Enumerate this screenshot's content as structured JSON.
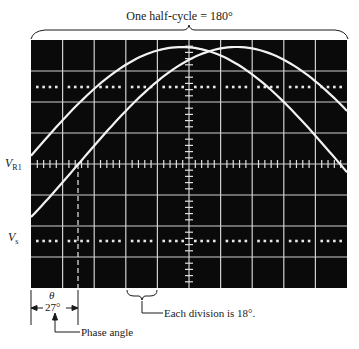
{
  "figure": {
    "title": "One half-cycle = 180°",
    "left_labels": {
      "vr1_main": "V",
      "vr1_sub": "R1",
      "vs_main": "V",
      "vs_sub": "s"
    },
    "phase_symbol": "θ",
    "phase_value": "27°",
    "phase_label": "Phase angle",
    "division_note": "Each division is 18°.",
    "colors": {
      "screen": "#0a0a0a",
      "grid": "#d8d8d8",
      "trace": "#f2f2f2",
      "ink": "#1a1a1a",
      "background": "#ffffff"
    },
    "grid": {
      "columns": 10,
      "rows": 8,
      "degrees_per_division": 18
    },
    "traces": [
      {
        "name": "V_R1",
        "description": "leading waveform, zero crossing at 0°"
      },
      {
        "name": "V_s",
        "description": "lagging waveform, zero crossing at 27°"
      }
    ]
  }
}
